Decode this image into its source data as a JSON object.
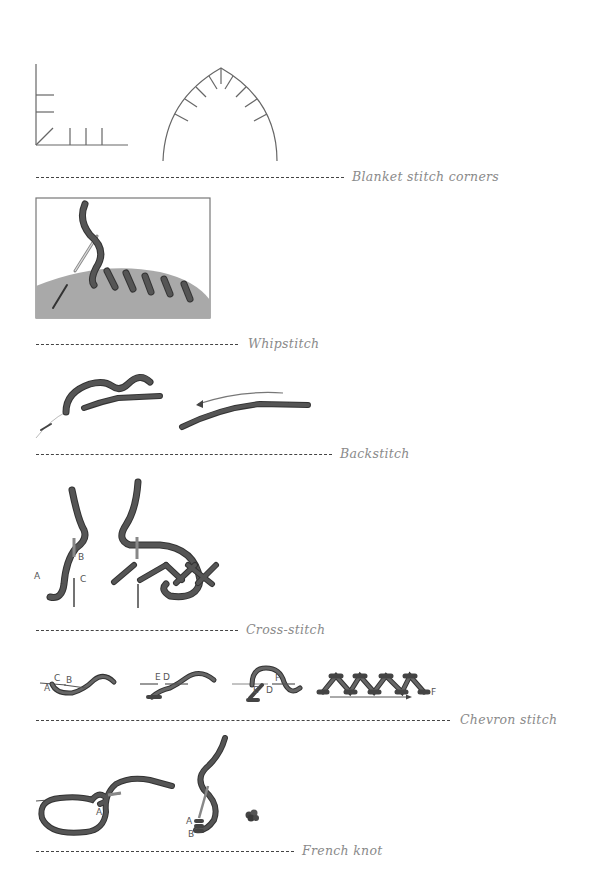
{
  "sections": [
    {
      "id": "blanket",
      "label": "Blanket stitch corners"
    },
    {
      "id": "whip",
      "label": "Whipstitch"
    },
    {
      "id": "back",
      "label": "Backstitch"
    },
    {
      "id": "cross",
      "label": "Cross-stitch",
      "point_labels": [
        "A",
        "B",
        "C"
      ]
    },
    {
      "id": "chevron",
      "label": "Chevron stitch",
      "point_labels": [
        "A",
        "C",
        "B",
        "E",
        "D",
        "E",
        "D",
        "F",
        "F"
      ]
    },
    {
      "id": "french",
      "label": "French knot",
      "point_labels": [
        "A",
        "A",
        "B"
      ]
    }
  ],
  "colors": {
    "thread": "#555555",
    "thread_outline": "#333333",
    "fabric": "#a9a9a9",
    "line": "#666666",
    "label": "#8a8a8a"
  }
}
